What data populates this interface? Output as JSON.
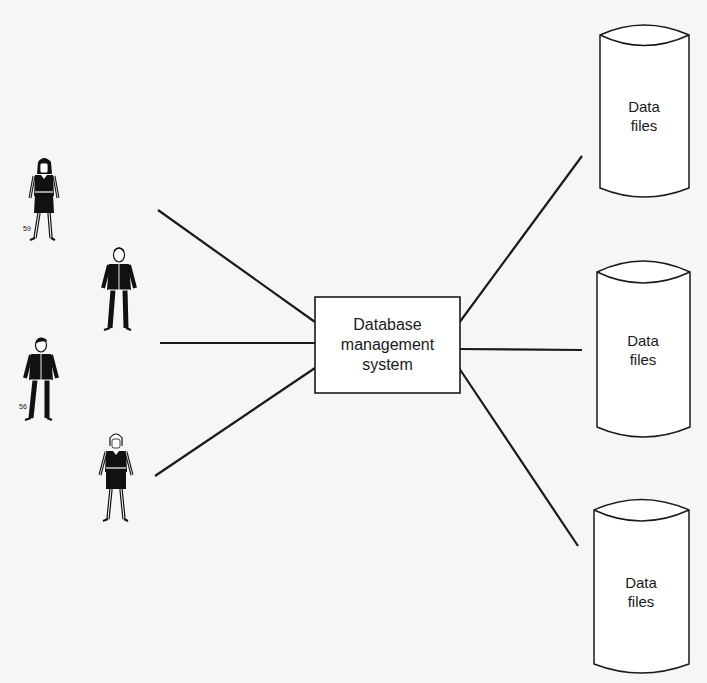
{
  "diagram": {
    "center": {
      "lines": [
        "Database",
        "management",
        "system"
      ],
      "box": {
        "x": 315,
        "y": 297,
        "w": 145,
        "h": 96
      }
    },
    "users": [
      {
        "id": "user-1",
        "kind": "woman",
        "x": 44,
        "y": 160,
        "caption": "59"
      },
      {
        "id": "user-2",
        "kind": "man",
        "x": 119,
        "y": 248,
        "caption": ""
      },
      {
        "id": "user-3",
        "kind": "man",
        "x": 41,
        "y": 338,
        "caption": "56"
      },
      {
        "id": "user-4",
        "kind": "woman",
        "x": 116,
        "y": 436,
        "caption": ""
      }
    ],
    "data_stores": [
      {
        "id": "store-1",
        "label_lines": [
          "Data",
          "files"
        ],
        "x": 597,
        "y": 25,
        "w": 94,
        "h": 176
      },
      {
        "id": "store-2",
        "label_lines": [
          "Data",
          "files"
        ],
        "x": 597,
        "y": 259,
        "w": 94,
        "h": 182
      },
      {
        "id": "store-3",
        "label_lines": [
          "Data",
          "files"
        ],
        "x": 594,
        "y": 500,
        "w": 95,
        "h": 176
      }
    ],
    "connections": {
      "left": [
        {
          "from": [
            158,
            210
          ],
          "to": [
            315,
            322
          ]
        },
        {
          "from": [
            160,
            343
          ],
          "to": [
            315,
            343
          ]
        },
        {
          "from": [
            155,
            476
          ],
          "to": [
            315,
            368
          ]
        }
      ],
      "right": [
        {
          "from": [
            459,
            323
          ],
          "to": [
            582,
            156
          ]
        },
        {
          "from": [
            459,
            349
          ],
          "to": [
            582,
            350
          ]
        },
        {
          "from": [
            459,
            368
          ],
          "to": [
            578,
            546
          ]
        }
      ]
    },
    "colors": {
      "ink": "#1a1a1a",
      "paper": "#f6f6f4",
      "fill": "#ffffff"
    }
  }
}
